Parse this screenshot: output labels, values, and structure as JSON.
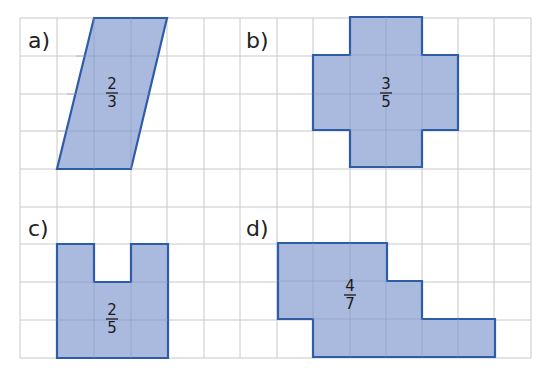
{
  "grid": {
    "x0": 20,
    "y0": 18,
    "cols": 14,
    "rows": 9,
    "cell_w": 36.5,
    "cell_h": 37.8,
    "line_color": "#c8c8c8"
  },
  "colors": {
    "fill": "#aabadf",
    "stroke": "#2e5da8"
  },
  "figures": [
    {
      "id": "a",
      "label": "a)",
      "numerator": "2",
      "denominator": "3",
      "shape": "parallelogram"
    },
    {
      "id": "b",
      "label": "b)",
      "numerator": "3",
      "denominator": "5",
      "shape": "cross"
    },
    {
      "id": "c",
      "label": "c)",
      "numerator": "2",
      "denominator": "5",
      "shape": "u-shape"
    },
    {
      "id": "d",
      "label": "d)",
      "numerator": "4",
      "denominator": "7",
      "shape": "stepped-polygon"
    }
  ]
}
